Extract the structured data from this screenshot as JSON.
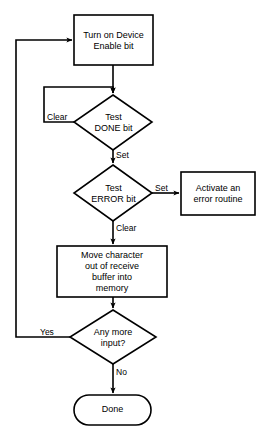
{
  "diagram": {
    "background_color": "#ffffff",
    "line_color": "#000000",
    "text_color": "#000000",
    "nodes": {
      "turn_on_device": {
        "shape": "process",
        "label": "Turn on Device\nEnable bit"
      },
      "test_done": {
        "shape": "decision",
        "label": "Test\nDONE bit"
      },
      "test_error": {
        "shape": "decision",
        "label": "Test\nERROR bit"
      },
      "activate_error_routine": {
        "shape": "process",
        "label": "Activate an\nerror routine"
      },
      "move_character": {
        "shape": "process",
        "label": "Move character\nout of receive\nbuffer into\nmemory"
      },
      "any_more_input": {
        "shape": "decision",
        "label": "Any more\ninput?"
      },
      "done": {
        "shape": "terminator",
        "label": "Done"
      }
    },
    "edge_labels": {
      "done_clear": "Clear",
      "done_set": "Set",
      "error_set": "Set",
      "error_clear": "Clear",
      "input_yes": "Yes",
      "input_no": "No"
    }
  }
}
